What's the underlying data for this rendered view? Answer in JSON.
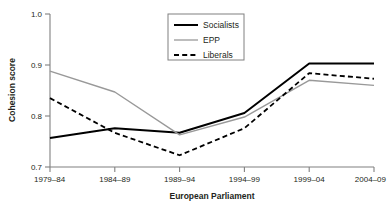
{
  "chart_data": {
    "type": "line",
    "title": "",
    "xlabel": "European Parliament",
    "ylabel": "Cohesion score",
    "categories": [
      "1979–84",
      "1984–89",
      "1989–94",
      "1994–99",
      "1999–04",
      "2004–09"
    ],
    "ylim": [
      0.7,
      1.0
    ],
    "yticks": [
      "0.7",
      "0.8",
      "0.9",
      "1.0"
    ],
    "ytick_values": [
      0.7,
      0.8,
      0.9,
      1.0
    ],
    "grid": false,
    "legend_position": "top-center",
    "series": [
      {
        "name": "Socialists",
        "style": "solid",
        "color": "#000000",
        "width": 2.0,
        "values": [
          0.757,
          0.776,
          0.767,
          0.806,
          0.903,
          0.903
        ]
      },
      {
        "name": "EPP",
        "style": "solid",
        "color": "#999999",
        "width": 1.4,
        "values": [
          0.888,
          0.847,
          0.763,
          0.798,
          0.87,
          0.86
        ]
      },
      {
        "name": "Liberals",
        "style": "dashed",
        "color": "#000000",
        "width": 1.8,
        "values": [
          0.835,
          0.767,
          0.723,
          0.776,
          0.884,
          0.873
        ]
      }
    ]
  },
  "axes": {
    "frame_color": "#808080",
    "tick_color": "#808080",
    "text_color": "#231f20"
  },
  "legend": {
    "border_color": "#808080",
    "background": "#ffffff",
    "items": [
      {
        "label": "Socialists",
        "style": "solid",
        "color": "#000000"
      },
      {
        "label": "EPP",
        "style": "solid",
        "color": "#999999"
      },
      {
        "label": "Liberals",
        "style": "dashed",
        "color": "#000000"
      }
    ]
  }
}
